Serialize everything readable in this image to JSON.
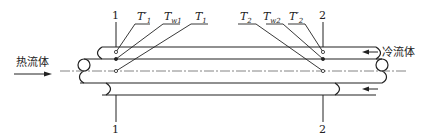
{
  "diagram": {
    "type": "double-pipe heat exchanger schematic",
    "hot_fluid": {
      "label": "热流体",
      "direction": "left-to-right"
    },
    "cold_fluid": {
      "label": "冷流体",
      "direction": "right-to-left"
    },
    "sections": [
      {
        "id": "1",
        "top_label": "1",
        "bottom_label": "1"
      },
      {
        "id": "2",
        "top_label": "2",
        "bottom_label": "2"
      }
    ],
    "section1_labels": [
      {
        "main": "T",
        "prime": "′",
        "sub": "1"
      },
      {
        "main": "T",
        "prime": "",
        "sub": "w1"
      },
      {
        "main": "T",
        "prime": "",
        "sub": "1"
      }
    ],
    "section2_labels": [
      {
        "main": "T",
        "prime": "",
        "sub": "2"
      },
      {
        "main": "T",
        "prime": "",
        "sub": "w2"
      },
      {
        "main": "T",
        "prime": "′",
        "sub": "2"
      }
    ],
    "colors": {
      "stroke": "#222222",
      "background": "#ffffff"
    }
  }
}
